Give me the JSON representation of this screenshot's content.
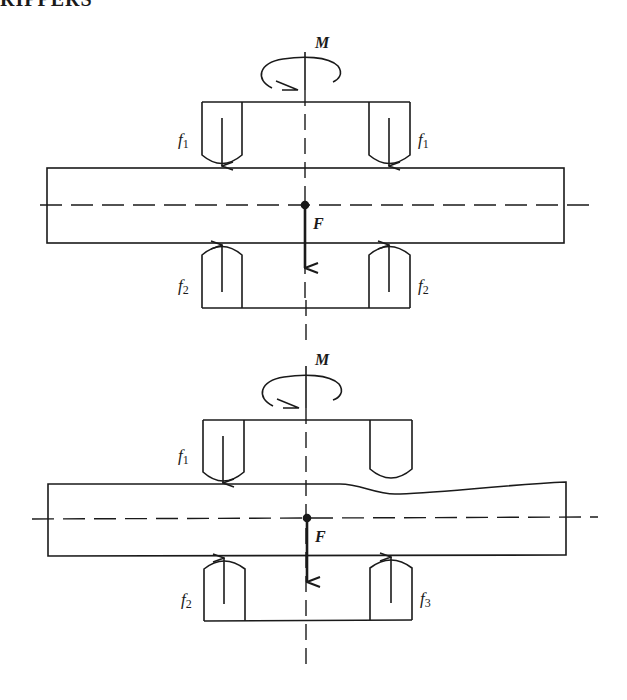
{
  "header": {
    "text": "RIPPERS"
  },
  "diagrams": [
    {
      "id": "balanced",
      "moment_label": "M",
      "force_label": "F",
      "labels": [
        {
          "name": "f1-left",
          "base": "f",
          "sub": "1"
        },
        {
          "name": "f1-right",
          "base": "f",
          "sub": "1"
        },
        {
          "name": "f2-left",
          "base": "f",
          "sub": "2"
        },
        {
          "name": "f2-right",
          "base": "f",
          "sub": "2"
        }
      ]
    },
    {
      "id": "deformed",
      "moment_label": "M",
      "force_label": "F",
      "labels": [
        {
          "name": "f1-left",
          "base": "f",
          "sub": "1"
        },
        {
          "name": "f2-left",
          "base": "f",
          "sub": "2"
        },
        {
          "name": "f3-right",
          "base": "f",
          "sub": "3"
        }
      ]
    }
  ],
  "colors": {
    "ink": "#1a1a1a",
    "background": "#ffffff"
  }
}
